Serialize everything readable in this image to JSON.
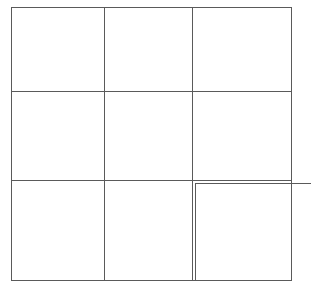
{
  "grid": {
    "rows": 3,
    "columns": 3,
    "line_color": "#5a5a5a",
    "background": "#ffffff",
    "selected_cell": {
      "row": 2,
      "column": 2
    },
    "cells": [
      [
        {
          "label": ""
        },
        {
          "label": ""
        },
        {
          "label": ""
        }
      ],
      [
        {
          "label": ""
        },
        {
          "label": ""
        },
        {
          "label": ""
        }
      ],
      [
        {
          "label": ""
        },
        {
          "label": ""
        },
        {
          "label": ""
        }
      ]
    ]
  }
}
